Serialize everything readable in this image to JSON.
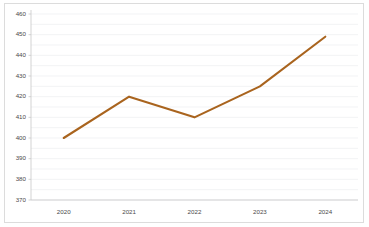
{
  "chart_data": {
    "type": "line",
    "title": "",
    "subtitle": "",
    "xlabel": "",
    "ylabel": "",
    "categories": [
      "2020",
      "2021",
      "2022",
      "2023",
      "2024"
    ],
    "x": [
      2020,
      2021,
      2022,
      2023,
      2024
    ],
    "series": [
      {
        "name": "",
        "values": [
          400,
          420,
          410,
          425,
          449
        ],
        "color": "#A9641E"
      }
    ],
    "ylim": [
      370,
      460
    ],
    "ytick_labels": [
      "460",
      "450",
      "440",
      "430",
      "420",
      "410",
      "400",
      "390",
      "380",
      "370"
    ],
    "ytick_values": [
      460,
      450,
      440,
      430,
      420,
      410,
      400,
      390,
      380,
      370
    ],
    "ytick_step": 10,
    "xtick_labels": [
      "2020",
      "2021",
      "2022",
      "2023",
      "2024"
    ],
    "grid": true,
    "grid_axis": "y",
    "legend": false,
    "legend_position": "none",
    "markers": false,
    "annotations": [],
    "colors": {
      "line": "#A9641E",
      "gridline": "#ECEEF1",
      "axis": "#C8C8C8",
      "tick_text": "#4A4A4A",
      "background": "#FFFFFF",
      "border": "#DCDCDC"
    }
  }
}
